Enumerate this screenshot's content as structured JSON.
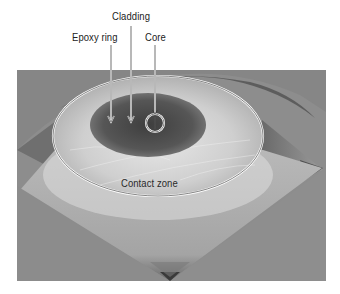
{
  "figure": {
    "labels": {
      "cladding": "Cladding",
      "epoxy_ring": "Epoxy ring",
      "core": "Core",
      "contact_zone": "Contact zone"
    },
    "colors": {
      "background": "#ffffff",
      "surface_base": "#8c8c8c",
      "cladding_dark": "#4a4a4a",
      "contact_light": "#d8d8d8",
      "outline_white": "#ffffff",
      "outline_dark": "#3a3a3a",
      "label_text": "#222222"
    }
  }
}
